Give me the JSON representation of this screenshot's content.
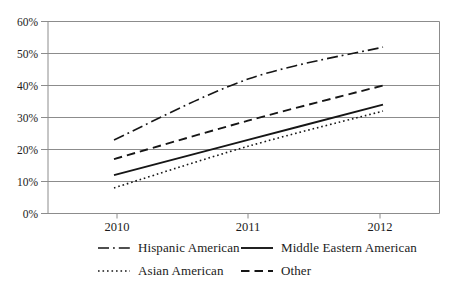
{
  "chart_data": {
    "type": "line",
    "title": "",
    "xlabel": "",
    "ylabel": "",
    "categories": [
      "2010",
      "2011",
      "2012"
    ],
    "y_tick_labels": [
      "0%",
      "10%",
      "20%",
      "30%",
      "40%",
      "50%",
      "60%"
    ],
    "ylim": [
      0,
      60
    ],
    "y_tick_step": 10,
    "grid": "horizontal",
    "legend_position": "bottom",
    "series": [
      {
        "name": "Hispanic American",
        "line_style": "dashdot",
        "values": [
          23,
          42,
          52
        ]
      },
      {
        "name": "Middle Eastern American",
        "line_style": "solid",
        "values": [
          12,
          23,
          34
        ]
      },
      {
        "name": "Asian American",
        "line_style": "dotted",
        "values": [
          8,
          21,
          32
        ]
      },
      {
        "name": "Other",
        "line_style": "dashed",
        "values": [
          17,
          29,
          40
        ]
      }
    ],
    "colors": {
      "series_line": "#161616",
      "gridline": "#8c8c8c",
      "axis": "#8c8c8c",
      "tick_text": "#1b1b1b",
      "background": "#ffffff"
    }
  }
}
